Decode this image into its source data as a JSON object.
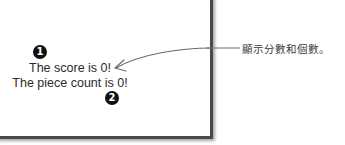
{
  "app": {
    "score_text": "The score is 0!",
    "piece_count_text": "The piece count is 0!"
  },
  "callouts": {
    "badge_1": "1",
    "badge_2": "2",
    "annotation": "顯示分數和個數。"
  },
  "colors": {
    "badge": "#111111",
    "text": "#2b2b2b",
    "annotation_ink": "#3a3a3a",
    "window_border": "#4a4a4a"
  }
}
